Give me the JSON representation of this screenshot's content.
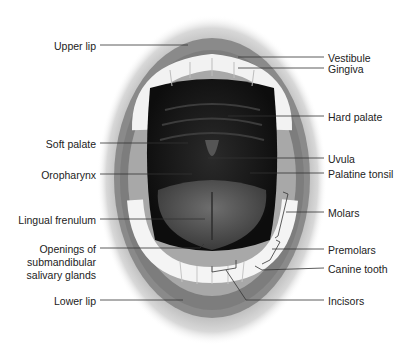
{
  "diagram": {
    "labels_left": [
      {
        "id": "upper-lip",
        "text": "Upper lip",
        "x": 20,
        "y": 40
      },
      {
        "id": "soft-palate",
        "text": "Soft palate",
        "x": 20,
        "y": 138
      },
      {
        "id": "oropharynx",
        "text": "Oropharynx",
        "x": 20,
        "y": 169
      },
      {
        "id": "lingual-frenulum",
        "text": "Lingual frenulum",
        "x": 20,
        "y": 214
      },
      {
        "id": "openings-1",
        "text": "Openings of",
        "x": 20,
        "y": 243
      },
      {
        "id": "openings-2",
        "text": "submandibular",
        "x": 20,
        "y": 256
      },
      {
        "id": "openings-3",
        "text": "salivary glands",
        "x": 20,
        "y": 269
      },
      {
        "id": "lower-lip",
        "text": "Lower lip",
        "x": 20,
        "y": 295
      }
    ],
    "labels_right": [
      {
        "id": "vestibule",
        "text": "Vestibule",
        "x": 328,
        "y": 52
      },
      {
        "id": "gingiva",
        "text": "Gingiva",
        "x": 328,
        "y": 64
      },
      {
        "id": "hard-palate",
        "text": "Hard palate",
        "x": 328,
        "y": 111
      },
      {
        "id": "uvula",
        "text": "Uvula",
        "x": 328,
        "y": 153
      },
      {
        "id": "palatine-tonsil",
        "text": "Palatine tonsil",
        "x": 328,
        "y": 168
      },
      {
        "id": "molars",
        "text": "Molars",
        "x": 328,
        "y": 207
      },
      {
        "id": "premolars",
        "text": "Premolars",
        "x": 328,
        "y": 244
      },
      {
        "id": "canine-tooth",
        "text": "Canine tooth",
        "x": 328,
        "y": 263
      },
      {
        "id": "incisors",
        "text": "Incisors",
        "x": 328,
        "y": 295
      }
    ]
  }
}
